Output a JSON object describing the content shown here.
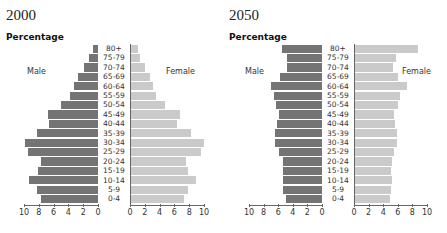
{
  "chart_data": [
    {
      "type": "bar",
      "subtype": "population-pyramid",
      "title": "2000",
      "ylabel": "Percentage",
      "legend": [
        "Male",
        "Female"
      ],
      "categories": [
        "80+",
        "75-79",
        "70-74",
        "65-69",
        "60-64",
        "55-59",
        "50-54",
        "45-49",
        "40-44",
        "35-39",
        "30-34",
        "25-29",
        "20-24",
        "15-19",
        "10-14",
        "5-9",
        "0-4"
      ],
      "series": [
        {
          "name": "Male",
          "color": "#747474",
          "values": [
            0.7,
            1.2,
            1.9,
            2.7,
            3.2,
            3.8,
            5.0,
            6.8,
            6.6,
            8.2,
            9.9,
            9.5,
            7.7,
            8.1,
            9.3,
            8.2,
            7.7
          ]
        },
        {
          "name": "Female",
          "color": "#cacaca",
          "values": [
            1.1,
            1.3,
            2.0,
            2.7,
            3.1,
            3.5,
            4.7,
            6.8,
            6.3,
            8.2,
            10.0,
            9.6,
            7.6,
            7.8,
            8.9,
            7.8,
            7.3
          ]
        }
      ],
      "xticks_male": [
        "10",
        "8",
        "6",
        "4",
        "2",
        "0"
      ],
      "xticks_female": [
        "0",
        "2",
        "4",
        "6",
        "8",
        "10"
      ],
      "xlim": [
        0,
        10
      ]
    },
    {
      "type": "bar",
      "subtype": "population-pyramid",
      "title": "2050",
      "ylabel": "Percentage",
      "legend": [
        "Male",
        "Female"
      ],
      "categories": [
        "80+",
        "75-79",
        "70-74",
        "65-69",
        "60-64",
        "55-59",
        "50-54",
        "45-49",
        "40-44",
        "35-39",
        "30-34",
        "25-29",
        "20-24",
        "15-19",
        "10-14",
        "5-9",
        "0-4"
      ],
      "series": [
        {
          "name": "Male",
          "color": "#747474",
          "values": [
            5.5,
            4.8,
            4.8,
            5.7,
            7.0,
            6.6,
            6.3,
            5.9,
            6.1,
            6.5,
            6.4,
            5.9,
            5.4,
            5.3,
            5.4,
            5.3,
            5.0
          ]
        },
        {
          "name": "Female",
          "color": "#cacaca",
          "values": [
            8.8,
            5.8,
            5.3,
            6.0,
            7.2,
            6.3,
            6.0,
            5.5,
            5.6,
            5.9,
            5.9,
            5.5,
            5.2,
            5.0,
            5.2,
            5.0,
            4.9
          ]
        }
      ],
      "xticks_male": [
        "10",
        "8",
        "6",
        "4",
        "2",
        "0"
      ],
      "xticks_female": [
        "0",
        "2",
        "4",
        "6",
        "8",
        "10"
      ],
      "xlim": [
        0,
        10
      ]
    }
  ]
}
